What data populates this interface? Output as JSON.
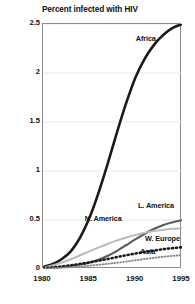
{
  "chart_data": {
    "type": "line",
    "title": "Percent infected with HIV",
    "xlabel": "",
    "ylabel": "",
    "xlim": [
      1980,
      1995
    ],
    "ylim": [
      0,
      2.5
    ],
    "grid": true,
    "legend_position": "inline-labels",
    "x_ticks": [
      "1980",
      "1985",
      "1990",
      "1995"
    ],
    "x_tick_values": [
      1980,
      1985,
      1990,
      1995
    ],
    "y_ticks": [
      "0",
      "0.5",
      "1",
      "1.5",
      "2",
      "2.5"
    ],
    "y_tick_values": [
      0,
      0.5,
      1,
      1.5,
      2,
      2.5
    ],
    "x": [
      1980,
      1981,
      1982,
      1983,
      1984,
      1985,
      1986,
      1987,
      1988,
      1989,
      1990,
      1991,
      1992,
      1993,
      1994,
      1995
    ],
    "series": [
      {
        "name": "Africa",
        "style": "solid",
        "color": "#1a1a1a",
        "width": 2.6,
        "values": [
          0.02,
          0.05,
          0.1,
          0.18,
          0.32,
          0.52,
          0.78,
          1.08,
          1.4,
          1.7,
          1.96,
          2.15,
          2.29,
          2.39,
          2.46,
          2.5
        ],
        "label_x": 1991.2,
        "label_y": 2.34
      },
      {
        "name": "L. America",
        "style": "solid",
        "color": "#5b5b5b",
        "width": 2.1,
        "values": [
          0.01,
          0.015,
          0.02,
          0.03,
          0.045,
          0.065,
          0.095,
          0.135,
          0.185,
          0.245,
          0.305,
          0.36,
          0.41,
          0.45,
          0.478,
          0.498
        ],
        "label_x": 1992.3,
        "label_y": 0.63
      },
      {
        "name": "N. America",
        "style": "solid",
        "color": "#b9b9b9",
        "width": 2.0,
        "values": [
          0.01,
          0.035,
          0.065,
          0.1,
          0.14,
          0.18,
          0.22,
          0.258,
          0.292,
          0.322,
          0.348,
          0.37,
          0.388,
          0.4,
          0.41,
          0.415
        ],
        "label_x": 1986.6,
        "label_y": 0.5
      },
      {
        "name": "W. Europe",
        "style": "dotted",
        "color": "#1a1a1a",
        "width": 2.6,
        "values": [
          0.008,
          0.016,
          0.026,
          0.038,
          0.052,
          0.068,
          0.085,
          0.103,
          0.122,
          0.141,
          0.158,
          0.174,
          0.189,
          0.202,
          0.213,
          0.222
        ],
        "label_x": 1993.0,
        "label_y": 0.295
      },
      {
        "name": "Asia",
        "style": "dotted",
        "color": "#8a8a8a",
        "width": 1.9,
        "values": [
          0.004,
          0.008,
          0.013,
          0.019,
          0.026,
          0.034,
          0.043,
          0.053,
          0.064,
          0.076,
          0.089,
          0.102,
          0.114,
          0.125,
          0.134,
          0.142
        ],
        "label_x": 1991.4,
        "label_y": 0.165
      }
    ]
  }
}
